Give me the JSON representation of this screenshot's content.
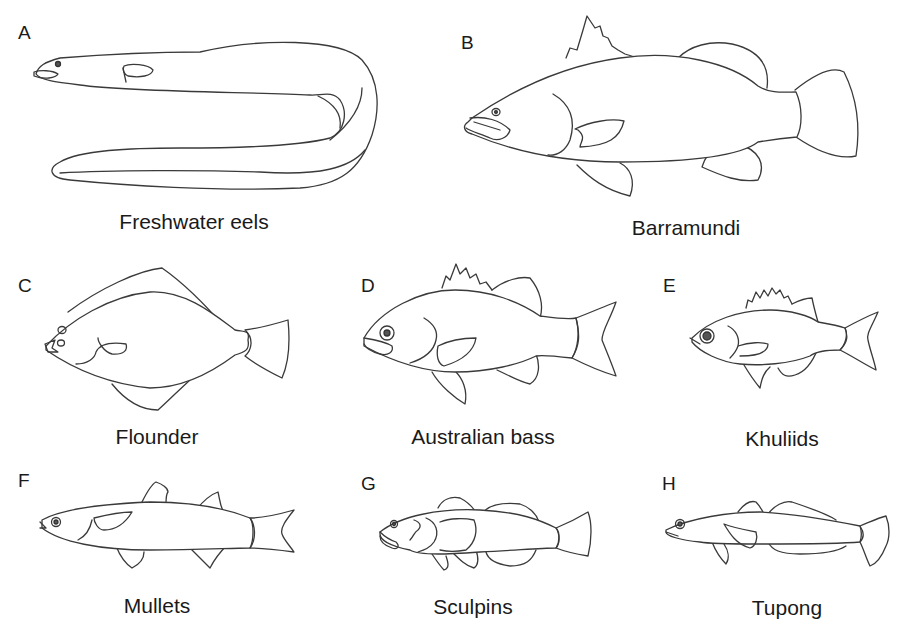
{
  "figure": {
    "panels": [
      {
        "letter": "A",
        "name": "Freshwater eels"
      },
      {
        "letter": "B",
        "name": "Barramundi"
      },
      {
        "letter": "C",
        "name": "Flounder"
      },
      {
        "letter": "D",
        "name": "Australian bass"
      },
      {
        "letter": "E",
        "name": "Khuliids"
      },
      {
        "letter": "F",
        "name": "Mullets"
      },
      {
        "letter": "G",
        "name": "Sculpins"
      },
      {
        "letter": "H",
        "name": "Tupong"
      }
    ],
    "style": {
      "background": "#ffffff",
      "line_color": "#3a3a3a",
      "text_color": "#1a1a1a"
    }
  }
}
